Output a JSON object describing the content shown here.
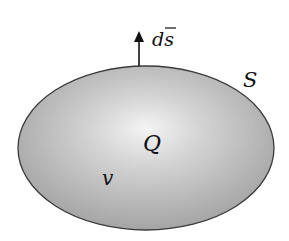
{
  "diagram": {
    "type": "closed-surface-gauss",
    "region": {
      "shape": "ellipse",
      "center": [
        146,
        148
      ],
      "rx": 128,
      "ry": 82,
      "fill_center_color": "#f4f4f4",
      "fill_edge_color": "#a2a2a2",
      "stroke_color": "#3a3a3a"
    },
    "labels": {
      "surface_element": "ds",
      "surface": "S",
      "charge": "Q",
      "volume": "v"
    },
    "arrow": {
      "from": [
        139,
        66
      ],
      "to": [
        139,
        34
      ],
      "color": "#111111"
    }
  }
}
